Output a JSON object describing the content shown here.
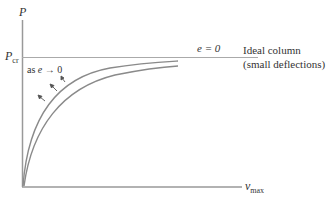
{
  "diagram": {
    "y_axis_label": "P",
    "x_axis_label_main": "v",
    "x_axis_label_sub": "max",
    "pcr_label_main": "P",
    "pcr_label_sub": "cr",
    "e_zero_label": "e = 0",
    "ideal_line1": "Ideal column",
    "ideal_line2": "(small deflections)",
    "trend_label_prefix": "as ",
    "trend_label_var": "e",
    "trend_label_suffix": " → 0"
  },
  "colors": {
    "axis": "#999999",
    "curve": "#8a8a8a",
    "text": "#333333"
  }
}
